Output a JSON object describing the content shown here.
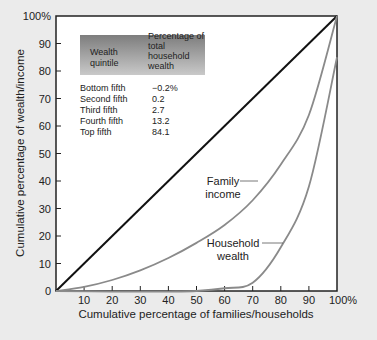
{
  "chart_data": {
    "type": "line",
    "title": "",
    "xlabel": "Cumulative percentage of families/households",
    "ylabel": "Cumulative percentage of wealth/income",
    "xlim": [
      0,
      100
    ],
    "ylim": [
      0,
      100
    ],
    "grid": false,
    "x_ticks": [
      "10",
      "20",
      "30",
      "40",
      "50",
      "60",
      "70",
      "80",
      "90",
      "100%"
    ],
    "y_ticks": [
      "0",
      "10",
      "20",
      "30",
      "40",
      "50",
      "60",
      "70",
      "80",
      "90",
      "100%"
    ],
    "series": [
      {
        "name": "Line of equality",
        "color": "#111111",
        "x": [
          0,
          100
        ],
        "y": [
          0,
          100
        ]
      },
      {
        "name": "Family income",
        "color": "#8a8a8a",
        "x": [
          0,
          10,
          20,
          30,
          40,
          50,
          60,
          70,
          80,
          90,
          100
        ],
        "y": [
          0,
          1.5,
          4,
          7.5,
          12,
          17.5,
          24,
          33,
          46,
          64,
          100
        ]
      },
      {
        "name": "Household wealth",
        "color": "#8a8a8a",
        "x": [
          0,
          20,
          40,
          50,
          60,
          70,
          80,
          90,
          100
        ],
        "y": [
          0,
          -0.2,
          -0.2,
          0,
          1,
          3,
          15.9,
          38,
          85
        ]
      }
    ],
    "annotations": [
      {
        "text": "Family income",
        "x": 67,
        "y": 48
      },
      {
        "text": "Household wealth",
        "x": 66,
        "y": 20
      }
    ],
    "inset_table": {
      "headers": [
        "Wealth quintile",
        "Percentage of total household wealth"
      ],
      "rows": [
        [
          "Bottom fifth",
          "−0.2%"
        ],
        [
          "Second fifth",
          "0.2"
        ],
        [
          "Third fifth",
          "2.7"
        ],
        [
          "Fourth fifth",
          "13.2"
        ],
        [
          "Top fifth",
          "84.1"
        ]
      ]
    }
  },
  "labels": {
    "family_income_1": "Family",
    "family_income_2": "income",
    "household_wealth_1": "Household",
    "household_wealth_2": "wealth",
    "table_h1_1": "Wealth",
    "table_h1_2": "quintile",
    "table_h2_1": "Percentage of",
    "table_h2_2": "total household",
    "table_h2_3": "wealth"
  }
}
